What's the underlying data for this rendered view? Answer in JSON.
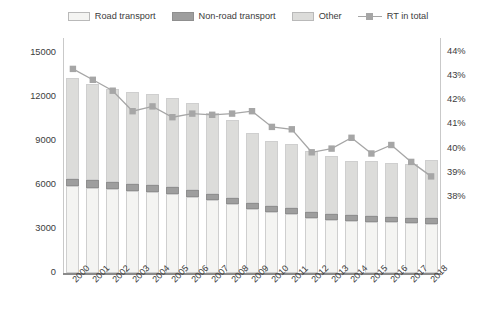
{
  "legend": {
    "items": [
      {
        "label": "Road transport",
        "type": "swatch",
        "color": "#f4f4f2",
        "name": "legend-road-transport"
      },
      {
        "label": "Non-road transport",
        "type": "swatch",
        "color": "#9e9e9e",
        "name": "legend-non-road-transport"
      },
      {
        "label": "Other",
        "type": "swatch",
        "color": "#dcdcda",
        "name": "legend-other"
      },
      {
        "label": "RT in total",
        "type": "line",
        "color": "#a6a6a6",
        "name": "legend-rt-in-total"
      }
    ]
  },
  "axes": {
    "ylabel_left": "Emissions [kt]",
    "yticks_left": [
      "0",
      "3000",
      "6000",
      "9000",
      "12000",
      "15000"
    ],
    "yticks_right": [
      "38%",
      "39%",
      "40%",
      "41%",
      "42%",
      "43%",
      "44%"
    ]
  },
  "chart_data": {
    "type": "bar",
    "title": "",
    "xlabel": "",
    "ylabel": "Emissions [kt]",
    "ylabel_secondary": "RT in total",
    "ylim": [
      0,
      16000
    ],
    "ylim_secondary": [
      0.375,
      0.44
    ],
    "ytick_values": [
      0,
      3000,
      6000,
      9000,
      12000,
      15000
    ],
    "ytick_values_secondary": [
      0.38,
      0.39,
      0.4,
      0.41,
      0.42,
      0.43,
      0.44
    ],
    "grid": false,
    "legend_position": "top",
    "stacked": true,
    "categories": [
      "2000",
      "2001",
      "2002",
      "2003",
      "2004",
      "2005",
      "2006",
      "2007",
      "2008",
      "2009",
      "2010",
      "2011",
      "2012",
      "2013",
      "2014",
      "2015",
      "2016",
      "2017",
      "2018"
    ],
    "series": [
      {
        "name": "Road transport",
        "color": "#f4f4f2",
        "values": [
          5900,
          5800,
          5700,
          5600,
          5500,
          5400,
          5200,
          4950,
          4700,
          4350,
          4150,
          4050,
          3750,
          3600,
          3550,
          3500,
          3450,
          3400,
          3350
        ]
      },
      {
        "name": "Non-road transport",
        "color": "#9e9e9e",
        "values": [
          500,
          500,
          480,
          470,
          470,
          460,
          450,
          430,
          430,
          420,
          410,
          400,
          400,
          390,
          390,
          380,
          380,
          370,
          370
        ]
      },
      {
        "name": "Other",
        "color": "#dcdcda",
        "values": [
          6900,
          6600,
          6320,
          6230,
          6230,
          6040,
          5950,
          5520,
          5270,
          4730,
          4440,
          4350,
          4150,
          3960,
          3710,
          3720,
          3670,
          3630,
          3980
        ]
      },
      {
        "name": "RT in total",
        "type": "line",
        "axis": "secondary",
        "color": "#a6a6a6",
        "values": [
          0.433,
          0.4285,
          0.424,
          0.4155,
          0.4175,
          0.413,
          0.4145,
          0.414,
          0.4145,
          0.4155,
          0.409,
          0.408,
          0.3985,
          0.4,
          0.4045,
          0.398,
          0.4015,
          0.3945,
          0.3885
        ]
      }
    ],
    "totals": [
      13300,
      12900,
      12500,
      12300,
      12200,
      11900,
      11600,
      10900,
      10400,
      9500,
      9000,
      8800,
      8300,
      7950,
      7650,
      7600,
      7500,
      7400,
      7700
    ]
  }
}
